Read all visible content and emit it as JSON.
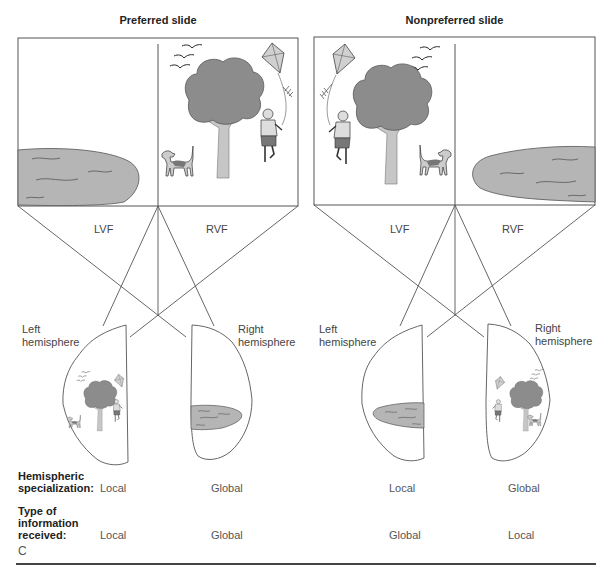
{
  "figure": {
    "panel_letter": "C",
    "colors": {
      "lake": "#b5b5b5",
      "tree": "#8c8c8c",
      "line": "#555555"
    }
  },
  "panels": [
    {
      "title": "Preferred slide",
      "field_labels": {
        "left": "LVF",
        "right": "RVF"
      },
      "hemispheres": {
        "left": {
          "label_line1": "Left",
          "label_line2": "hemisphere",
          "content": "local-scene"
        },
        "right": {
          "label_line1": "Right",
          "label_line2": "hemisphere",
          "content": "global-lake"
        }
      },
      "specialization": {
        "left": "Local",
        "right": "Global"
      },
      "received": {
        "left": "Local",
        "right": "Global"
      }
    },
    {
      "title": "Nonpreferred slide",
      "field_labels": {
        "left": "LVF",
        "right": "RVF"
      },
      "hemispheres": {
        "left": {
          "label_line1": "Left",
          "label_line2": "hemisphere",
          "content": "global-lake"
        },
        "right": {
          "label_line1": "Right",
          "label_line2": "hemisphere",
          "content": "local-scene"
        }
      },
      "specialization": {
        "left": "Local",
        "right": "Global"
      },
      "received": {
        "left": "Global",
        "right": "Local"
      }
    }
  ],
  "row_labels": {
    "specialization_line1": "Hemispheric",
    "specialization_line2": "specialization:",
    "received_line1": "Type of",
    "received_line2": "information",
    "received_line3": "received:"
  }
}
